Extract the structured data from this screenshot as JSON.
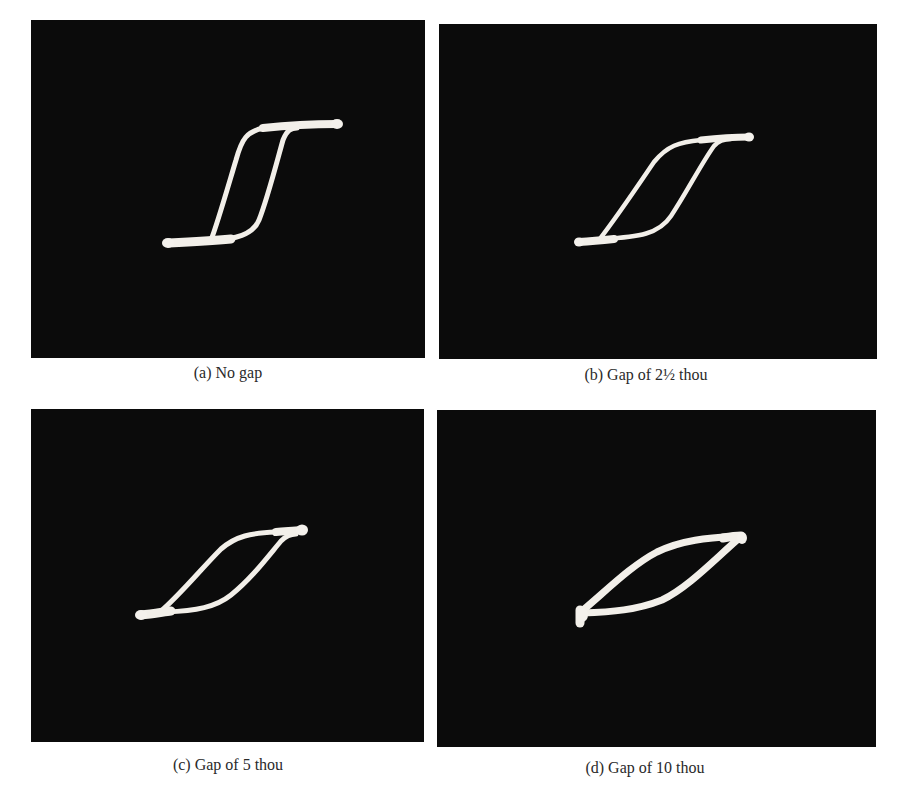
{
  "figure": {
    "panels": [
      {
        "id": "a",
        "label": "(a)",
        "caption": "(a) No gap",
        "gap": "none",
        "box": {
          "x": 31,
          "y": 20,
          "w": 394,
          "h": 338
        }
      },
      {
        "id": "b",
        "label": "(b)",
        "caption": "(b) Gap of 2½ thou",
        "gap": "2½ thou",
        "box": {
          "x": 439,
          "y": 24,
          "w": 438,
          "h": 335
        }
      },
      {
        "id": "c",
        "label": "(c)",
        "caption": "(c) Gap of 5 thou",
        "gap": "5 thou",
        "box": {
          "x": 31,
          "y": 409,
          "w": 393,
          "h": 333
        }
      },
      {
        "id": "d",
        "label": "(d)",
        "caption": "(d) Gap of 10 thou",
        "gap": "10 thou",
        "box": {
          "x": 437,
          "y": 410,
          "w": 439,
          "h": 337
        }
      }
    ],
    "colors": {
      "background": "#ffffff",
      "screen": "#0b0b0b",
      "trace": "#f2efe9",
      "caption_text": "#2a2a2a"
    }
  }
}
